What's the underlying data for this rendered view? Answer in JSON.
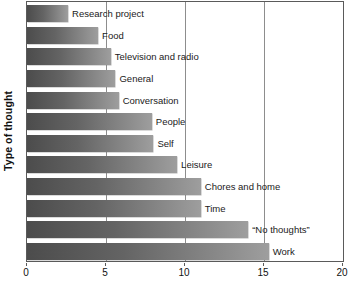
{
  "chart_data": {
    "type": "bar",
    "orientation": "horizontal",
    "title": "",
    "xlabel": "",
    "ylabel": "Type of thought",
    "xlim": [
      0,
      20
    ],
    "xticks": [
      0,
      5,
      10,
      15,
      20
    ],
    "xtick_labels": [
      "0",
      "5",
      "10",
      "15",
      "20"
    ],
    "gridlines": [
      5,
      10,
      15
    ],
    "grid": true,
    "legend": false,
    "bar_color": "#646464",
    "bar_gradient": [
      "#4c4c4c",
      "#9e9e9e"
    ],
    "categories": [
      "Research project",
      "Food",
      "Television and radio",
      "General",
      "Conversation",
      "People",
      "Self",
      "Leisure",
      "Chores and home",
      "Time",
      "“No thoughts”",
      "Work"
    ],
    "values": [
      2.6,
      4.5,
      5.3,
      5.6,
      5.8,
      7.9,
      8.0,
      9.5,
      11.0,
      11.0,
      14.0,
      15.3
    ]
  }
}
